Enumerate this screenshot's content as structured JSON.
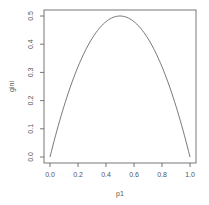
{
  "chart_data": {
    "type": "line",
    "title": "",
    "xlabel": "p1",
    "ylabel": "gini",
    "xlim": [
      0.0,
      1.0
    ],
    "ylim": [
      0.0,
      0.5
    ],
    "x_ticks": [
      "0.0",
      "0.2",
      "0.4",
      "0.6",
      "0.8",
      "1.0"
    ],
    "y_ticks": [
      "0.0",
      "0.1",
      "0.2",
      "0.3",
      "0.4",
      "0.5"
    ],
    "grid": false,
    "legend": null,
    "series": [
      {
        "name": "gini",
        "formula": "2*p1*(1-p1)",
        "x": [
          0.0,
          0.05,
          0.1,
          0.15,
          0.2,
          0.25,
          0.3,
          0.35,
          0.4,
          0.45,
          0.5,
          0.55,
          0.6,
          0.65,
          0.7,
          0.75,
          0.8,
          0.85,
          0.9,
          0.95,
          1.0
        ],
        "values": [
          0.0,
          0.095,
          0.18,
          0.255,
          0.32,
          0.375,
          0.42,
          0.455,
          0.48,
          0.495,
          0.5,
          0.495,
          0.48,
          0.455,
          0.42,
          0.375,
          0.32,
          0.255,
          0.18,
          0.095,
          0.0
        ]
      }
    ],
    "colors": {
      "line": "#555555",
      "axis": "#555555",
      "box": "#555555"
    }
  }
}
